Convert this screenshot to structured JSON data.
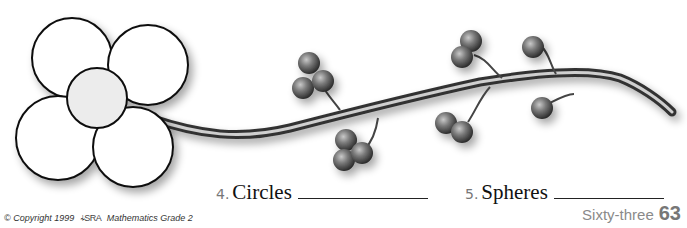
{
  "illustration": {
    "flower": {
      "petals": 4,
      "center": "circle"
    },
    "branch": {
      "berry_clusters": 6,
      "spheres": "gray balls"
    }
  },
  "questions": [
    {
      "number": "4.",
      "label": "Circles",
      "answer": ""
    },
    {
      "number": "5.",
      "label": "Spheres",
      "answer": ""
    }
  ],
  "footer": {
    "copyright": "© Copyright 1999",
    "publisher_logo": "SRA/McGraw-Hill",
    "book": "Mathematics Grade 2",
    "page_word": "Sixty-three",
    "page_number": "63"
  }
}
